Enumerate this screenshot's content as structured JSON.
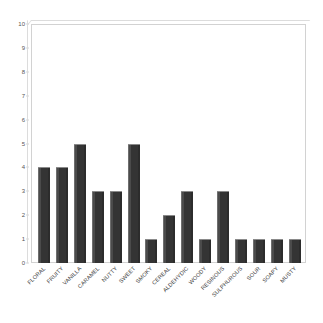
{
  "chart_data": {
    "type": "bar",
    "title": "",
    "subtitle": "",
    "xlabel": "",
    "ylabel": "",
    "ylim": [
      0,
      10
    ],
    "ytick_step": 1,
    "yticks": [
      "10",
      "9",
      "8",
      "7",
      "6",
      "5",
      "4",
      "3",
      "2",
      "1",
      "0"
    ],
    "grid": false,
    "legend": false,
    "legend_position": "none",
    "bar_style": "3d-shaded",
    "bar_color": "#3b3b3b",
    "plot_background": "#ffffff",
    "frame_color": "#d2d2d2",
    "tick_label_color": "#555555",
    "category_label_color": "#3a3a3a",
    "category_label_rotation": -45,
    "categories": [
      "FLORAL",
      "FRUITY",
      "VANILLA",
      "CARAMEL",
      "NUTTY",
      "SWEET",
      "SMOKY",
      "CEREAL",
      "ALDEHYDIC",
      "WOODY",
      "RESINOUS",
      "SULPHUROUS",
      "SOUR",
      "SOAPY",
      "MUSTY"
    ],
    "values": [
      4,
      4,
      5,
      3,
      3,
      5,
      1,
      2,
      3,
      1,
      3,
      1,
      1,
      1,
      1
    ]
  }
}
